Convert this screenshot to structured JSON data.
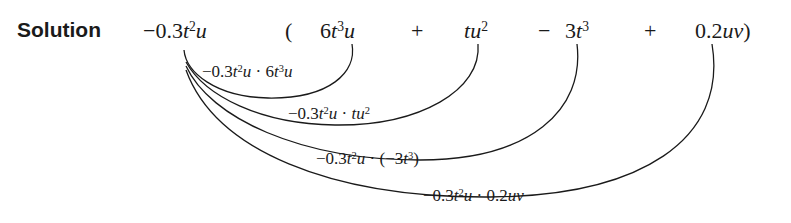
{
  "label": "Solution",
  "expression": {
    "multiplier": {
      "sign": "−",
      "coef": "0.3",
      "v1": "t",
      "e1": "2",
      "v2": "u"
    },
    "open_paren": "(",
    "close_paren": ")",
    "terms": [
      {
        "op": "",
        "coef": "6",
        "v1": "t",
        "e1": "3",
        "v2": "u",
        "e2": ""
      },
      {
        "op": "+",
        "coef": "",
        "v1": "t",
        "e1": "",
        "v2": "u",
        "e2": "2"
      },
      {
        "op": "−",
        "coef": "3",
        "v1": "t",
        "e1": "3",
        "v2": "",
        "e2": ""
      },
      {
        "op": "+",
        "coef": "0.2",
        "v1": "u",
        "e1": "",
        "v2": "v",
        "e2": ""
      }
    ]
  },
  "products": [
    {
      "left": "−0.3",
      "lv": "t",
      "le": "2",
      "lv2": "u",
      "dot": "·",
      "right_pre": "6",
      "rv": "t",
      "re": "3",
      "rv2": "u",
      "rpost": ""
    },
    {
      "left": "−0.3",
      "lv": "t",
      "le": "2",
      "lv2": "u",
      "dot": "·",
      "right_pre": "",
      "rv": "tu",
      "re": "2",
      "rv2": "",
      "rpost": ""
    },
    {
      "left": "−0.3",
      "lv": "t",
      "le": "2",
      "lv2": "u",
      "dot": "·",
      "right_pre": "(−3",
      "rv": "t",
      "re": "3",
      "rv2": "",
      "rpost": ")"
    },
    {
      "left": "−0.3",
      "lv": "t",
      "le": "2",
      "lv2": "u",
      "dot": "·",
      "right_pre": "0.2",
      "rv": "uv",
      "re": "",
      "rv2": "",
      "rpost": ""
    }
  ]
}
